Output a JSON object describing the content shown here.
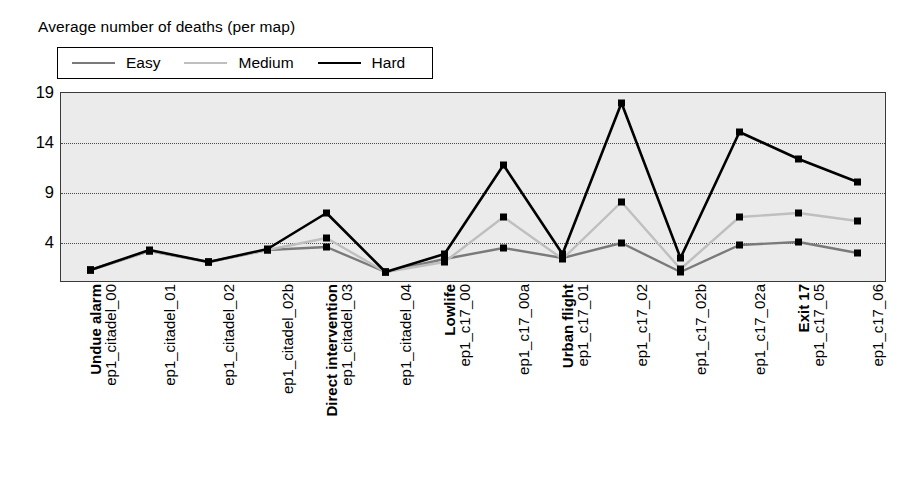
{
  "chart_data": {
    "type": "line",
    "title": "Average number of deaths (per map)",
    "xlabel": "",
    "ylabel": "",
    "ylim": [
      0,
      19
    ],
    "yticks": [
      4,
      9,
      14,
      19
    ],
    "grid": true,
    "legend_position": "top-left",
    "categories": [
      "ep1_citadel_00",
      "ep1_citadel_01",
      "ep1_citadel_02",
      "ep1_citadel_02b",
      "ep1_citadel_03",
      "ep1_citadel_04",
      "ep1_c17_00",
      "ep1_c17_00a",
      "ep1_c17_01",
      "ep1_c17_02",
      "ep1_c17_02b",
      "ep1_c17_02a",
      "ep1_c17_05",
      "ep1_c17_06"
    ],
    "group_labels": [
      {
        "index": 0,
        "label": "Undue alarm"
      },
      {
        "index": 4,
        "label": "Direct intervention"
      },
      {
        "index": 6,
        "label": "Lowlife"
      },
      {
        "index": 8,
        "label": "Urban flight"
      },
      {
        "index": 12,
        "label": "Exit 17"
      }
    ],
    "series": [
      {
        "name": "Easy",
        "color": "#7a7a7a",
        "values": [
          1.3,
          3.2,
          2.1,
          3.3,
          3.6,
          1.1,
          2.4,
          3.5,
          2.5,
          4.0,
          1.1,
          3.8,
          4.1,
          3.0
        ]
      },
      {
        "name": "Medium",
        "color": "#bfbfbf",
        "values": [
          1.3,
          3.2,
          2.1,
          3.3,
          4.5,
          1.1,
          2.1,
          6.6,
          2.4,
          8.1,
          1.4,
          6.6,
          7.0,
          6.2
        ]
      },
      {
        "name": "Hard",
        "color": "#000000",
        "values": [
          1.3,
          3.3,
          2.1,
          3.4,
          7.0,
          1.1,
          2.9,
          11.8,
          2.9,
          18.0,
          2.5,
          15.1,
          12.4,
          10.1
        ]
      }
    ]
  },
  "legend": {
    "items": [
      {
        "label": "Easy",
        "color": "#7a7a7a"
      },
      {
        "label": "Medium",
        "color": "#bfbfbf"
      },
      {
        "label": "Hard",
        "color": "#000000"
      }
    ]
  },
  "axis": {
    "y_tick_labels": [
      "19",
      "14",
      "9",
      "4"
    ]
  }
}
